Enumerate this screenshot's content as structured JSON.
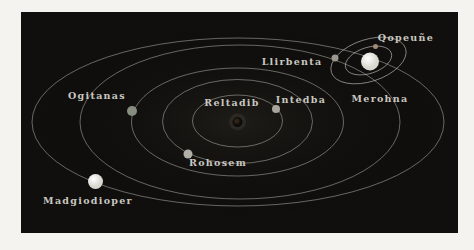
{
  "diagram": {
    "type": "orbital-system-map",
    "page_background": "#f4f3ef",
    "panel": {
      "x": 21,
      "y": 12,
      "width": 437,
      "height": 221,
      "fill": "#100f0d"
    },
    "style": {
      "orbit_color": "#d9d7cf",
      "orbit_opacity": 0.55,
      "label_color": "#c9c7c0",
      "star_glow_color": "#b4aa96"
    },
    "center": {
      "x": 237.5,
      "y": 122
    },
    "orbits": [
      {
        "cx": 237.5,
        "cy": 121,
        "rx": 45,
        "ry": 26
      },
      {
        "cx": 237.5,
        "cy": 121.5,
        "rx": 75,
        "ry": 42
      },
      {
        "cx": 237.5,
        "cy": 122,
        "rx": 106,
        "ry": 54
      },
      {
        "cx": 240,
        "cy": 122,
        "rx": 160,
        "ry": 77
      },
      {
        "cx": 238,
        "cy": 122,
        "rx": 206,
        "ry": 84
      }
    ],
    "moon_system": {
      "host": "Merohna",
      "cx": 368.5,
      "cy": 60.5,
      "rotate": -18,
      "orbits": [
        {
          "rx": 24,
          "ry": 13
        },
        {
          "rx": 39,
          "ry": 21
        }
      ]
    },
    "bodies": [
      {
        "label": "Reltadib",
        "kind": "star",
        "x": 237.5,
        "y": 122,
        "r": 4.5,
        "color": "#241b13",
        "label_x": 232,
        "label_y": 106
      },
      {
        "label": "Intedba",
        "kind": "planet",
        "x": 276,
        "y": 109,
        "r": 4,
        "color": "#a6a49c",
        "label_x": 301,
        "label_y": 103
      },
      {
        "label": "Rohosem",
        "kind": "planet",
        "x": 188,
        "y": 154,
        "r": 4.5,
        "color": "#b0b0a8",
        "label_x": 218,
        "label_y": 166
      },
      {
        "label": "Ogitanas",
        "kind": "planet",
        "x": 132,
        "y": 111,
        "r": 5,
        "color": "#878d81",
        "label_x": 97,
        "label_y": 99
      },
      {
        "label": "Llirbenta",
        "kind": "planet",
        "x": 335,
        "y": 58,
        "r": 3.5,
        "color": "#9b978e",
        "label_x": 292,
        "label_y": 65
      },
      {
        "label": "Merohna",
        "kind": "planet",
        "x": 370,
        "y": 61.5,
        "r": 9,
        "color": "#f5f3ec",
        "label_x": 380,
        "label_y": 102
      },
      {
        "label": "Qopeuñe",
        "kind": "moon",
        "x": 375.5,
        "y": 46.5,
        "r": 2.5,
        "color": "#a08b76",
        "label_x": 406,
        "label_y": 41
      },
      {
        "label": "Madgiodioper",
        "kind": "planet",
        "x": 95.5,
        "y": 181.5,
        "r": 7.5,
        "color": "#e7e7e1",
        "label_x": 88,
        "label_y": 204
      }
    ]
  }
}
